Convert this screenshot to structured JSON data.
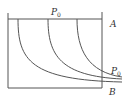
{
  "diagram": {
    "labels": {
      "top_pressure": "P",
      "top_pressure_sub": "0",
      "right_pressure": "P",
      "right_pressure_sub": "0",
      "point_a": "A",
      "point_b": "B"
    },
    "colors": {
      "line": "#555555",
      "background": "#ffffff"
    }
  }
}
